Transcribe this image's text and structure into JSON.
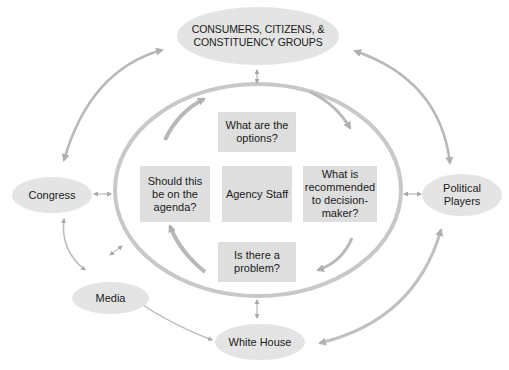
{
  "diagram": {
    "center": {
      "label": "Agency Staff"
    },
    "cycle_steps": [
      {
        "id": "problem",
        "label": "Is there a problem?"
      },
      {
        "id": "agenda",
        "label": "Should this be on the agenda?"
      },
      {
        "id": "options",
        "label": "What are the options?"
      },
      {
        "id": "recommend",
        "label": "What is recommended to decision-maker?"
      }
    ],
    "outer_actors": [
      {
        "id": "consumers",
        "label": "CONSUMERS, CITIZENS, & CONSTITUENCY GROUPS"
      },
      {
        "id": "congress",
        "label": "Congress"
      },
      {
        "id": "political",
        "label": "Political Players"
      },
      {
        "id": "media",
        "label": "Media"
      },
      {
        "id": "whitehouse",
        "label": "White House"
      }
    ],
    "connections": [
      {
        "from": "consumers",
        "to": "agency_ring",
        "type": "bidirectional"
      },
      {
        "from": "congress",
        "to": "agency_ring",
        "type": "bidirectional"
      },
      {
        "from": "political",
        "to": "agency_ring",
        "type": "bidirectional"
      },
      {
        "from": "whitehouse",
        "to": "agency_ring",
        "type": "bidirectional"
      },
      {
        "from": "consumers",
        "to": "congress",
        "type": "bidirectional"
      },
      {
        "from": "consumers",
        "to": "political",
        "type": "bidirectional"
      },
      {
        "from": "congress",
        "to": "media",
        "type": "bidirectional"
      },
      {
        "from": "media",
        "to": "whitehouse",
        "type": "bidirectional"
      },
      {
        "from": "whitehouse",
        "to": "political",
        "type": "bidirectional"
      }
    ],
    "colors": {
      "node_fill": "#e4e4e4",
      "box_fill": "#dedede",
      "arrow": "#b4b4b4",
      "ring": "#c8c8c8"
    }
  }
}
